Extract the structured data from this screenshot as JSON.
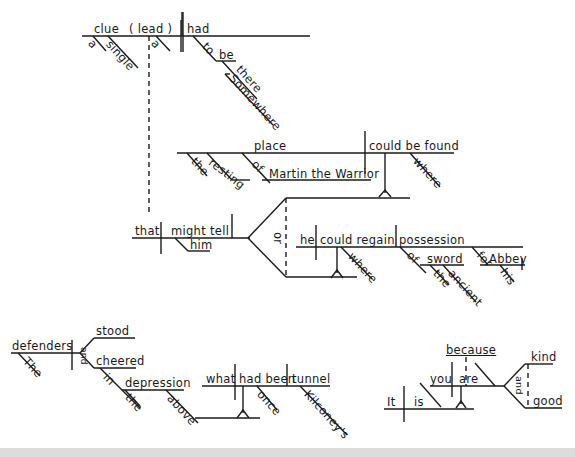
{
  "diagram": {
    "type": "sentence-diagram",
    "sentence_1": {
      "subject": "clue",
      "appositive": "( lead )",
      "verb": "had",
      "modifiers": [
        "a",
        "single",
        "a"
      ],
      "infinitive": [
        "to",
        "be"
      ],
      "adverbs": [
        "there",
        "Somewhere"
      ],
      "relative_clause": {
        "subject": "that",
        "verb": "might tell",
        "indirect_object": "him",
        "conjunction": "or",
        "clause_a": {
          "subject": "place",
          "modifiers": [
            "the",
            "resting"
          ],
          "prep": "of",
          "object": "Martin the Warrior",
          "verb": "could be found",
          "adverb": "where"
        },
        "clause_b": {
          "subject": "he",
          "verb": "could regain",
          "object": "possession",
          "adverb": "where",
          "prep1": "of",
          "prep1_object": "sword",
          "prep1_modifiers": [
            "the",
            "ancient"
          ],
          "prep2": "for",
          "prep2_object": "Abbey",
          "prep2_modifier": "his"
        }
      }
    },
    "sentence_2": {
      "subject": "defenders",
      "modifier": "The",
      "conjunction": "and",
      "verbs": [
        "stood",
        "cheered"
      ],
      "prep": "in",
      "prep_object": "depression",
      "prep_object_modifier": "the",
      "adverb": "above",
      "clause": {
        "subject": "what",
        "verb": "had been",
        "complement": "tunnel",
        "adverb": "once",
        "possessive": "Kilconey's"
      }
    },
    "sentence_3": {
      "subject": "It",
      "verb": "is",
      "clause": {
        "connector": "because",
        "subject": "you",
        "verb": "are",
        "conjunction": "and",
        "complements": [
          "kind",
          "good"
        ]
      }
    }
  }
}
